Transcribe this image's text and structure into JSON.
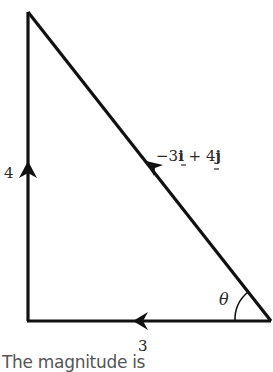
{
  "diagram": {
    "type": "vector-triangle",
    "vertical_side_label": "4",
    "horizontal_side_label": "3",
    "hypotenuse_label": {
      "prefix": "−3",
      "i": "i",
      "plus": " + 4",
      "j": "j"
    },
    "angle_label": "θ",
    "arrow_directions": {
      "vertical": "up",
      "horizontal": "left",
      "hypotenuse": "up-left"
    },
    "line_color": "#111111"
  },
  "caption": "The magnitude is"
}
